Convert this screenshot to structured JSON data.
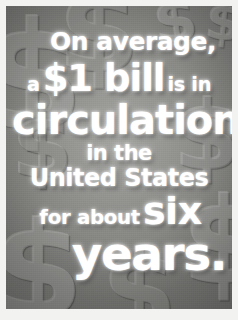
{
  "poster": {
    "full_text": "On average, a $1 bill is in circulation in the United States for about six years.",
    "subject": "US currency lifespan fact",
    "lines": [
      {
        "id": "average",
        "text": "On average,",
        "emphasis": "small"
      },
      {
        "id": "bill",
        "lead": "a",
        "strong": "$1 bill",
        "trail": "is in"
      },
      {
        "id": "circulation",
        "text": "circulation",
        "emphasis": "large"
      },
      {
        "id": "inthe",
        "text": "in the",
        "emphasis": "small"
      },
      {
        "id": "unitedstates",
        "text": "United States",
        "emphasis": "medium"
      },
      {
        "id": "sixline",
        "lead": "for about",
        "strong": "six"
      },
      {
        "id": "years",
        "text": "years.",
        "emphasis": "large"
      }
    ],
    "background": {
      "motif": "dollar-sign",
      "glyph": "$",
      "glyph_count": 9
    },
    "colors": {
      "text": "#ffffff",
      "background_mid": "#8c8c8a",
      "background_dark": "#7c7c79",
      "background_light": "#9a9a97",
      "frame": "#f2f2f0",
      "glow": "#ffffff"
    }
  }
}
